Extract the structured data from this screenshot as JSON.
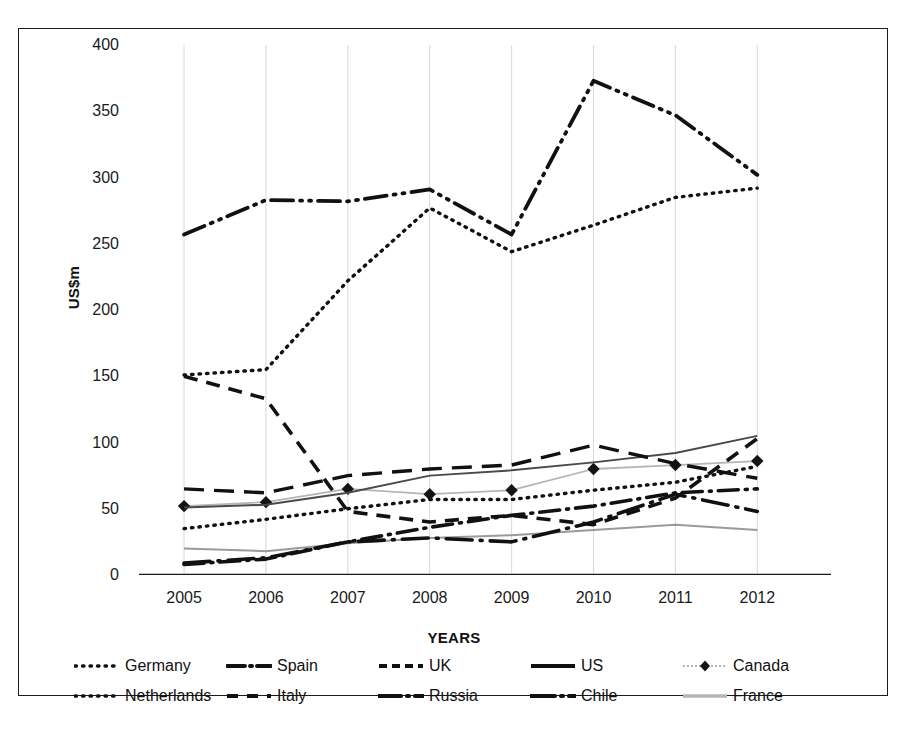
{
  "chart_data": {
    "type": "line",
    "title": "",
    "xlabel": "YEARS",
    "ylabel": "US$m",
    "categories": [
      "2005",
      "2006",
      "2007",
      "2008",
      "2009",
      "2010",
      "2011",
      "2012"
    ],
    "x": [
      2005,
      2006,
      2007,
      2008,
      2009,
      2010,
      2011,
      2012
    ],
    "ylim": [
      0,
      400
    ],
    "yticks": [
      0,
      50,
      100,
      150,
      200,
      250,
      300,
      350,
      400
    ],
    "ytick_labels": [
      "0",
      "50",
      "100",
      "150",
      "200",
      "250",
      "300",
      "350",
      "400"
    ],
    "grid": "vertical",
    "legend_position": "bottom",
    "series": [
      {
        "name": "Germany",
        "style": "dotted",
        "color": "#111111",
        "values": [
          35,
          42,
          50,
          57,
          57,
          64,
          70,
          82
        ]
      },
      {
        "name": "Spain",
        "style": "dash-dot-dot",
        "color": "#111111",
        "values": [
          257,
          283,
          282,
          291,
          257,
          373,
          347,
          302
        ]
      },
      {
        "name": "UK",
        "style": "dashed",
        "color": "#111111",
        "values": [
          150,
          133,
          48,
          40,
          45,
          38,
          58,
          103
        ]
      },
      {
        "name": "US",
        "style": "solid",
        "color": "#4a4a4a",
        "values": [
          51,
          53,
          62,
          75,
          79,
          85,
          92,
          105
        ]
      },
      {
        "name": "Canada",
        "style": "marker-diamond",
        "color": "#b5b5b5",
        "values": [
          52,
          55,
          65,
          61,
          64,
          80,
          83,
          86
        ]
      },
      {
        "name": "Netherlands",
        "style": "dotted",
        "color": "#111111",
        "values": [
          151,
          155,
          222,
          277,
          244,
          264,
          285,
          292
        ]
      },
      {
        "name": "Italy",
        "style": "dash-long",
        "color": "#111111",
        "values": [
          65,
          62,
          75,
          80,
          83,
          98,
          84,
          73
        ]
      },
      {
        "name": "Russia",
        "style": "dash-dot",
        "color": "#111111",
        "values": [
          8,
          12,
          25,
          36,
          45,
          52,
          62,
          65
        ]
      },
      {
        "name": "Chile",
        "style": "dash-dot-long",
        "color": "#111111",
        "values": [
          9,
          13,
          25,
          28,
          25,
          40,
          61,
          48
        ]
      },
      {
        "name": "France",
        "style": "solid-light",
        "color": "#9a9a9a",
        "values": [
          20,
          18,
          24,
          28,
          30,
          34,
          38,
          34
        ]
      }
    ]
  },
  "axes": {
    "y_title": "US$m",
    "x_title": "YEARS"
  },
  "legend": {
    "rows": [
      [
        {
          "label": "Germany",
          "swatch": "legend-swatch-dotted"
        },
        {
          "label": "Spain",
          "swatch": "legend-swatch-dash-dot-dot"
        },
        {
          "label": "UK",
          "swatch": "legend-swatch-dashed"
        },
        {
          "label": "US",
          "swatch": "legend-swatch-solid"
        },
        {
          "label": "Canada",
          "swatch": "legend-swatch-marker-diamond"
        }
      ],
      [
        {
          "label": "Netherlands",
          "swatch": "legend-swatch-dotted"
        },
        {
          "label": "Italy",
          "swatch": "legend-swatch-dash-long"
        },
        {
          "label": "Russia",
          "swatch": "legend-swatch-dash-dot"
        },
        {
          "label": "Chile",
          "swatch": "legend-swatch-dash-dot-long"
        },
        {
          "label": "France",
          "swatch": "legend-swatch-solid-light"
        }
      ]
    ]
  },
  "caption": ""
}
